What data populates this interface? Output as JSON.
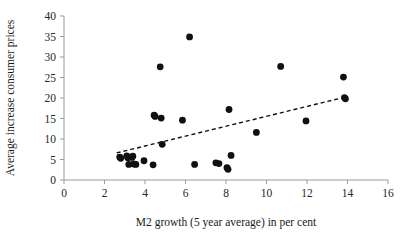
{
  "chart_data": {
    "type": "scatter",
    "title": "",
    "xlabel": "M2 growth (5 year average) in per cent",
    "ylabel": "Average increase consumer prices",
    "xlim": [
      0,
      16
    ],
    "ylim": [
      0,
      40
    ],
    "xticks": [
      0,
      2,
      4,
      6,
      8,
      10,
      12,
      14,
      16
    ],
    "yticks": [
      0,
      5,
      10,
      15,
      20,
      25,
      30,
      35,
      40
    ],
    "xtick_labels": [
      "0",
      "2",
      "4",
      "6",
      "8",
      "10",
      "12",
      "14",
      "16"
    ],
    "ytick_labels": [
      "0",
      "5",
      "10",
      "15",
      "20",
      "25",
      "30",
      "35",
      "40"
    ],
    "grid": false,
    "legend": "none",
    "marker": "filled-circle",
    "marker_color": "#111111",
    "series": [
      {
        "name": "countries",
        "points": [
          [
            2.75,
            5.6
          ],
          [
            2.8,
            5.3
          ],
          [
            3.1,
            5.9
          ],
          [
            3.15,
            5.4
          ],
          [
            3.2,
            3.8
          ],
          [
            3.35,
            5.5
          ],
          [
            3.4,
            5.8
          ],
          [
            3.45,
            3.9
          ],
          [
            3.55,
            3.8
          ],
          [
            3.95,
            4.7
          ],
          [
            4.4,
            3.7
          ],
          [
            4.45,
            15.8
          ],
          [
            4.5,
            15.5
          ],
          [
            4.75,
            27.6
          ],
          [
            4.8,
            15.1
          ],
          [
            4.85,
            8.7
          ],
          [
            5.85,
            14.6
          ],
          [
            6.2,
            34.9
          ],
          [
            6.45,
            3.8
          ],
          [
            7.5,
            4.2
          ],
          [
            7.65,
            4.0
          ],
          [
            8.05,
            3.0
          ],
          [
            8.1,
            2.6
          ],
          [
            8.15,
            17.2
          ],
          [
            8.25,
            6.0
          ],
          [
            9.5,
            11.6
          ],
          [
            10.7,
            27.7
          ],
          [
            11.95,
            14.4
          ],
          [
            13.8,
            25.1
          ],
          [
            13.85,
            20.1
          ],
          [
            13.9,
            19.8
          ]
        ]
      }
    ],
    "trendline": {
      "style": "dashed",
      "color": "#111111",
      "x_start": 2.6,
      "y_start": 6.6,
      "x_end": 13.95,
      "y_end": 20.3
    }
  }
}
